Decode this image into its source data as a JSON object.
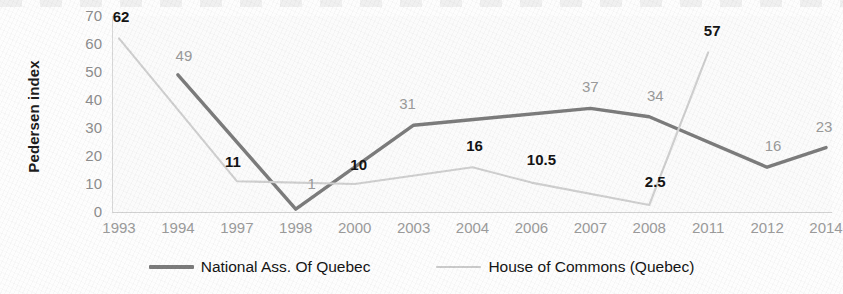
{
  "chart_data": {
    "type": "line",
    "title": "",
    "xlabel": "",
    "ylabel": "Pedersen index",
    "ylim": [
      0,
      70
    ],
    "y_ticks": [
      70,
      60,
      50,
      40,
      30,
      20,
      10,
      0
    ],
    "grid": false,
    "legend_position": "bottom",
    "categories": [
      "1993",
      "1994",
      "1997",
      "1998",
      "2000",
      "2003",
      "2004",
      "2006",
      "2007",
      "2008",
      "2011",
      "2012",
      "2014"
    ],
    "series": [
      {
        "name": "National Ass. Of Quebec",
        "color": "#7c7c7c",
        "style": "solid",
        "label_style": "plain-gray",
        "points": [
          {
            "x": "1994",
            "y": 49,
            "label": "49",
            "label_dx": 6,
            "label_dy": -20
          },
          {
            "x": "1998",
            "y": 1,
            "label": "1",
            "label_dx": 16,
            "label_dy": -26
          },
          {
            "x": "2003",
            "y": 31,
            "label": "31",
            "label_dx": -6,
            "label_dy": -22
          },
          {
            "x": "2007",
            "y": 37,
            "label": "37",
            "label_dx": 0,
            "label_dy": -22
          },
          {
            "x": "2008",
            "y": 34,
            "label": "34",
            "label_dx": 6,
            "label_dy": -22
          },
          {
            "x": "2012",
            "y": 16,
            "label": "16",
            "label_dx": 6,
            "label_dy": -22
          },
          {
            "x": "2014",
            "y": 23,
            "label": "23",
            "label_dx": -2,
            "label_dy": -22
          }
        ]
      },
      {
        "name": "House of Commons (Quebec)",
        "color": "#cfcfcf",
        "style": "solid-light",
        "label_style": "bold-black",
        "points": [
          {
            "x": "1993",
            "y": 62,
            "label": "62",
            "label_dx": 2,
            "label_dy": -22
          },
          {
            "x": "1997",
            "y": 11,
            "label": "11",
            "label_dx": -4,
            "label_dy": -20
          },
          {
            "x": "2000",
            "y": 10,
            "label": "10",
            "label_dx": 4,
            "label_dy": -20
          },
          {
            "x": "2004",
            "y": 16,
            "label": "16",
            "label_dx": 2,
            "label_dy": -22
          },
          {
            "x": "2006",
            "y": 10.5,
            "label": "10.5",
            "label_dx": 10,
            "label_dy": -24
          },
          {
            "x": "2008",
            "y": 2.5,
            "label": "2.5",
            "label_dx": 6,
            "label_dy": -24
          },
          {
            "x": "2011",
            "y": 57,
            "label": "57",
            "label_dx": 4,
            "label_dy": -22
          }
        ]
      }
    ]
  },
  "legend": {
    "entries": [
      {
        "label": "National Ass. Of Quebec",
        "color": "#7c7c7c",
        "weight": "thick"
      },
      {
        "label": "House of Commons (Quebec)",
        "color": "#cbcbcb",
        "weight": "thin"
      }
    ]
  }
}
